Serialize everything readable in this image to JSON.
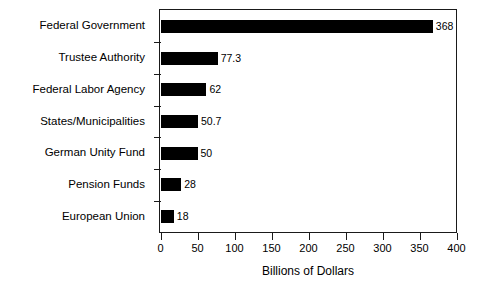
{
  "chart_data": {
    "type": "bar",
    "orientation": "horizontal",
    "title": "",
    "xlabel": "Billions of Dollars",
    "ylabel": "",
    "categories": [
      "Federal Government",
      "Trustee Authority",
      "Federal Labor Agency",
      "States/Municipalities",
      "German Unity Fund",
      "Pension Funds",
      "European Union"
    ],
    "values": [
      368,
      77.3,
      62,
      50.7,
      50,
      28,
      18
    ],
    "value_labels": [
      "368",
      "77.3",
      "62",
      "50.7",
      "50",
      "28",
      "18"
    ],
    "xlim": [
      0,
      400
    ],
    "xticks": [
      0,
      50,
      100,
      150,
      200,
      250,
      300,
      350,
      400
    ],
    "xtick_labels": [
      "0",
      "50",
      "100",
      "150",
      "200",
      "250",
      "300",
      "350",
      "400"
    ],
    "grid": false,
    "legend": null,
    "bar_color": "#000000",
    "background_color": "#ffffff",
    "axis_color": "#1a1a1a"
  }
}
